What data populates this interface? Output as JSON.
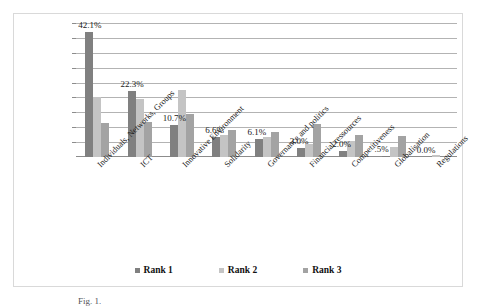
{
  "chart_data": {
    "type": "bar",
    "title": "",
    "subtitle": "",
    "xlabel": "",
    "ylabel": "",
    "grid": true,
    "legend_position": "bottom-center",
    "ylim": [
      0,
      45
    ],
    "gridline_count": 9,
    "categories": [
      "Individuals, Networks, Groups",
      "ICT",
      "Innovative Environment",
      "Solidarity",
      "Governance and politics",
      "Financial ressources",
      "Competitiveness",
      "Globalisation",
      "Regulations"
    ],
    "series": [
      {
        "name": "Rank 1",
        "color": "#808080",
        "values": [
          42.1,
          22.3,
          10.7,
          6.6,
          6.1,
          3.0,
          2.0,
          0.5,
          0.0
        ]
      },
      {
        "name": "Rank 2",
        "color": "#c4c4c4",
        "values": [
          20.0,
          19.5,
          22.5,
          7.5,
          6.8,
          4.5,
          5.5,
          3.5,
          0.8
        ]
      },
      {
        "name": "Rank 3",
        "color": "#a3a3a3",
        "values": [
          11.5,
          11.8,
          14.5,
          9.0,
          8.5,
          11.0,
          7.5,
          7.2,
          0.0
        ]
      }
    ],
    "data_labels": [
      "42.1%",
      "22.3%",
      "10.7%",
      "6.6%",
      "6.1%",
      "3.0%",
      "2.0%",
      ".5%",
      "0.0%"
    ],
    "data_labels_series": "Rank 1"
  },
  "legend": {
    "items": [
      {
        "label": "Rank 1",
        "swatch": "r1"
      },
      {
        "label": "Rank 2",
        "swatch": "r2"
      },
      {
        "label": "Rank 3",
        "swatch": "r3"
      }
    ]
  },
  "caption": {
    "text": "Fig. 1."
  }
}
